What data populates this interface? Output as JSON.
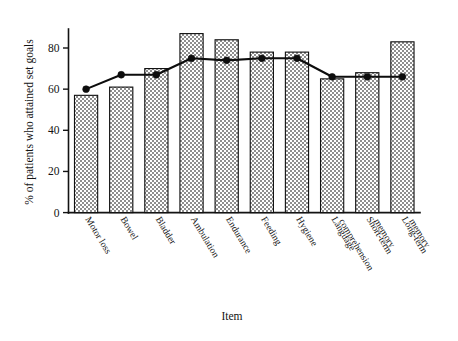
{
  "chart_data": {
    "type": "bar",
    "title": "",
    "xlabel": "Item",
    "ylabel": "% of patients who attained set goals",
    "categories": [
      "Motor loss",
      "Bowel",
      "Bladder",
      "Ambulation",
      "Endurance",
      "Feeding",
      "Hygiene",
      "Language comprehension",
      "Short-term memory",
      "Long-term memory"
    ],
    "series": [
      {
        "name": "% of patients who attained set goals",
        "type": "bar",
        "values": [
          57,
          61,
          70,
          87,
          84,
          78,
          78,
          65,
          68,
          83
        ]
      },
      {
        "name": "overlay line",
        "type": "line",
        "values": [
          60,
          67,
          67,
          75,
          74,
          75,
          75,
          66,
          66,
          66
        ]
      }
    ],
    "ylim": [
      0,
      92
    ],
    "ytick_labels": [
      "0",
      "20",
      "40",
      "60",
      "80"
    ],
    "ytick_values": [
      0,
      20,
      40,
      60,
      80
    ],
    "grid": false,
    "legend_position": "none",
    "colors": {
      "bar_fill": "#a8a8a8",
      "bar_edge": "#0f0f0f",
      "line": "#0d0d0d",
      "axis": "#131313",
      "background": "#ffffff"
    }
  }
}
